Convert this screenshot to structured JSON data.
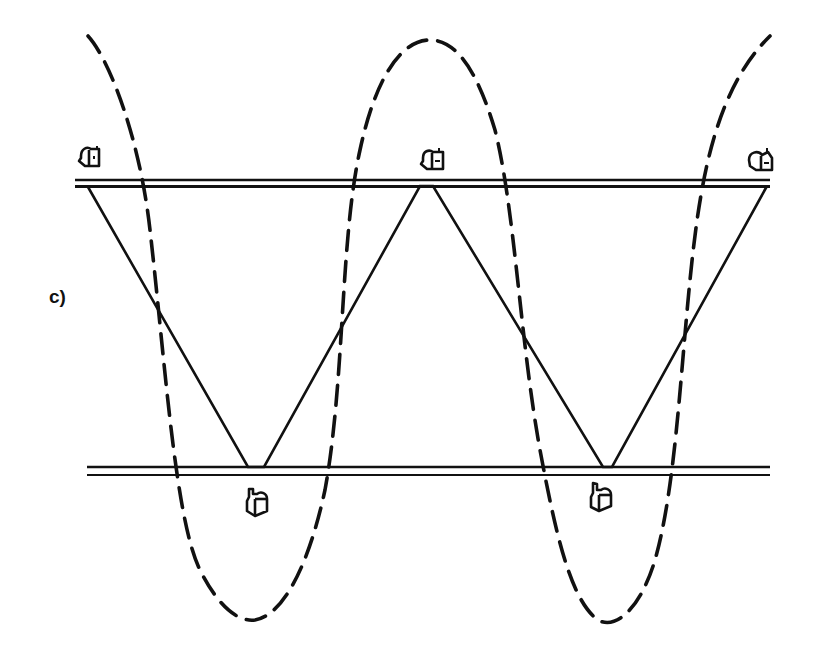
{
  "figure": {
    "panel_label": "c)",
    "stroke_color": "#111111",
    "background": "#ffffff",
    "rails": {
      "top": {
        "y1": 180,
        "y2": 186,
        "x_start": 75,
        "x_end": 770
      },
      "bottom": {
        "y1": 467,
        "y2": 475,
        "x_start": 87,
        "x_end": 770
      }
    },
    "zigzag_vertices": [
      {
        "x": 88,
        "y": 187
      },
      {
        "x": 248,
        "y": 467
      },
      {
        "x": 264,
        "y": 467
      },
      {
        "x": 420,
        "y": 186
      },
      {
        "x": 433,
        "y": 186
      },
      {
        "x": 603,
        "y": 467
      },
      {
        "x": 612,
        "y": 467
      },
      {
        "x": 767,
        "y": 186
      }
    ],
    "mailboxes_top": [
      {
        "name": "mailbox-top-left",
        "x": 77,
        "y": 147,
        "facing": "left"
      },
      {
        "name": "mailbox-top-middle",
        "x": 420,
        "y": 148,
        "facing": "left"
      },
      {
        "name": "mailbox-top-right",
        "x": 745,
        "y": 148,
        "facing": "left"
      }
    ],
    "mailboxes_bottom": [
      {
        "name": "mailbox-bottom-left",
        "x": 246,
        "y": 487,
        "facing": "up"
      },
      {
        "name": "mailbox-bottom-right",
        "x": 590,
        "y": 481,
        "facing": "up"
      }
    ],
    "dashed_curve": "M 88 36 C 110 60, 140 140, 150 230 C 165 360, 175 520, 200 570 C 220 610, 240 622, 255 620 C 285 615, 310 560, 325 490 C 345 380, 340 240, 360 150 C 375 80, 400 40, 430 40 C 460 40, 480 80, 495 130 C 515 210, 520 340, 540 450 C 555 530, 570 600, 598 620 C 615 630, 640 610, 655 560 C 675 490, 680 380, 690 280 C 700 180, 715 90, 770 36"
  }
}
